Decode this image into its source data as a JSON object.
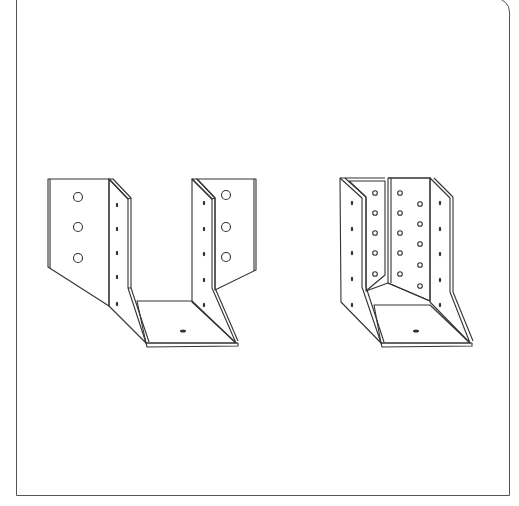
{
  "figure": {
    "items": [
      {
        "name": "external-flange-joist-hanger",
        "side": "left"
      },
      {
        "name": "internal-flange-joist-hanger",
        "side": "right"
      }
    ],
    "colors": {
      "line": "#333333",
      "background": "#ffffff",
      "frame": "#555555"
    }
  }
}
